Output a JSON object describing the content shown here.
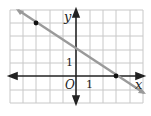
{
  "graph": {
    "type": "coordinate-plane-line",
    "axis_labels": {
      "x": "x",
      "y": "y",
      "origin": "O"
    },
    "tick_labels": {
      "x_unit": "1",
      "y_unit": "1"
    },
    "grid": {
      "x_min": -5,
      "x_max": 5,
      "y_min": -2,
      "y_max": 5
    },
    "line": {
      "slope": -0.6667,
      "y_intercept": 2,
      "equation": "y = -2/3 x + 2",
      "color": "#9a9a9a"
    },
    "points": [
      {
        "x": -3,
        "y": 4
      },
      {
        "x": 3,
        "y": 0
      }
    ],
    "colors": {
      "grid": "#c8c8c8",
      "axes": "#222222",
      "line": "#9a9a9a",
      "points": "#111111"
    }
  }
}
